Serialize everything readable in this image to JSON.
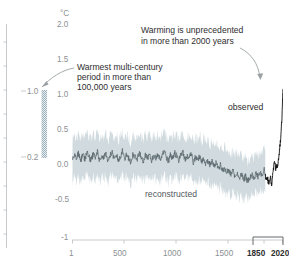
{
  "figure": {
    "yaxis_unit_label": "°C",
    "y_ticklabels": [
      "2.0",
      "1.5",
      "1.0",
      "0.5",
      "0.0",
      "-0.5",
      "-1"
    ],
    "x_ticklabels": [
      "1",
      "500",
      "1000",
      "1500",
      "1850",
      "2020"
    ],
    "x_bold_labels": [
      "1850",
      "2020"
    ],
    "series_labels": {
      "observed": "observed",
      "reconstructed": "reconstructed"
    },
    "annotations": {
      "left": [
        "Warmest multi-century",
        "period in more than",
        "100,000 years"
      ],
      "right": [
        "Warming is unprecedented",
        "in more than 2000 years"
      ]
    },
    "side_axis": {
      "labels": [
        "1.0",
        "0.2"
      ],
      "bar_top_value": "1.0",
      "bar_bottom_value": "0.2"
    },
    "colors": {
      "band": "#ccd7dc",
      "reconstructed_line": "#5b686f",
      "observed_line": "#111111",
      "axis": "#b9bdbf",
      "ticklabel": "#8c9194",
      "annotation_text": "#2e2e2e",
      "arrow": "#9aa0a3",
      "side_bar": "#b9c8ce"
    }
  },
  "chart_data": {
    "type": "line",
    "title": "",
    "xlabel": "",
    "ylabel": "°C",
    "xlim": [
      1,
      2020
    ],
    "ylim": [
      -1,
      2.0
    ],
    "yticks": [
      -1,
      -0.5,
      0.0,
      0.5,
      1.0,
      1.5,
      2.0
    ],
    "xticks": [
      1,
      500,
      1000,
      1500,
      1850,
      2020
    ],
    "grid": false,
    "legend": "inline-labels",
    "annotations": [
      {
        "text": "Warmest multi-century period in more than 100,000 years",
        "target": "side-bar",
        "x": 700,
        "y": 1.35
      },
      {
        "text": "Warming is unprecedented in more than 2000 years",
        "target": "observed-spike",
        "x": 1450,
        "y": 1.85
      }
    ],
    "side_bar": {
      "label": "multi-century warm period range",
      "y_from": 0.2,
      "y_to": 1.0,
      "ticks": [
        1.0,
        0.2
      ]
    },
    "series": [
      {
        "name": "reconstructed",
        "type": "line",
        "color": "#5b686f",
        "x": [
          1,
          20,
          40,
          60,
          80,
          100,
          120,
          140,
          160,
          180,
          200,
          220,
          240,
          260,
          280,
          300,
          320,
          340,
          360,
          380,
          400,
          420,
          440,
          460,
          480,
          500,
          520,
          540,
          560,
          580,
          600,
          620,
          640,
          660,
          680,
          700,
          720,
          740,
          760,
          780,
          800,
          820,
          840,
          860,
          880,
          900,
          920,
          940,
          960,
          980,
          1000,
          1020,
          1040,
          1060,
          1080,
          1100,
          1120,
          1140,
          1160,
          1180,
          1200,
          1220,
          1240,
          1260,
          1280,
          1300,
          1320,
          1340,
          1360,
          1380,
          1400,
          1420,
          1440,
          1460,
          1480,
          1500,
          1520,
          1540,
          1560,
          1580,
          1600,
          1620,
          1640,
          1660,
          1680,
          1700,
          1720,
          1740,
          1760,
          1780,
          1800,
          1820,
          1840,
          1850
        ],
        "y": [
          0.1,
          0.17,
          0.12,
          0.2,
          0.08,
          0.18,
          0.11,
          0.21,
          0.14,
          0.09,
          0.19,
          0.12,
          0.22,
          0.1,
          0.17,
          0.13,
          0.2,
          0.08,
          0.16,
          0.21,
          0.12,
          0.18,
          0.09,
          0.15,
          0.22,
          0.11,
          0.17,
          0.13,
          0.06,
          0.19,
          0.14,
          0.1,
          0.2,
          0.15,
          0.08,
          0.18,
          0.12,
          0.21,
          0.09,
          0.16,
          0.13,
          0.19,
          0.1,
          0.17,
          0.22,
          0.14,
          0.08,
          0.18,
          0.12,
          0.2,
          0.15,
          0.09,
          0.17,
          0.21,
          0.11,
          0.16,
          0.13,
          0.19,
          0.07,
          0.14,
          0.1,
          0.16,
          0.08,
          0.12,
          0.05,
          0.1,
          0.03,
          0.08,
          0.01,
          0.06,
          -0.02,
          0.04,
          -0.05,
          0.0,
          -0.08,
          -0.03,
          -0.1,
          -0.05,
          -0.12,
          -0.07,
          -0.15,
          -0.09,
          -0.18,
          -0.12,
          -0.2,
          -0.14,
          -0.1,
          -0.16,
          -0.08,
          -0.13,
          -0.06,
          -0.11,
          -0.04,
          -0.09
        ],
        "band_lower": [
          -0.2,
          -0.12,
          -0.18,
          -0.1,
          -0.22,
          -0.12,
          -0.19,
          -0.09,
          -0.16,
          -0.21,
          -0.11,
          -0.18,
          -0.08,
          -0.2,
          -0.13,
          -0.17,
          -0.1,
          -0.22,
          -0.14,
          -0.09,
          -0.18,
          -0.12,
          -0.21,
          -0.15,
          -0.08,
          -0.19,
          -0.13,
          -0.17,
          -0.24,
          -0.11,
          -0.16,
          -0.2,
          -0.1,
          -0.15,
          -0.22,
          -0.12,
          -0.18,
          -0.09,
          -0.21,
          -0.14,
          -0.17,
          -0.11,
          -0.2,
          -0.13,
          -0.08,
          -0.16,
          -0.22,
          -0.12,
          -0.18,
          -0.1,
          -0.15,
          -0.21,
          -0.13,
          -0.09,
          -0.19,
          -0.14,
          -0.17,
          -0.11,
          -0.23,
          -0.16,
          -0.2,
          -0.14,
          -0.22,
          -0.18,
          -0.25,
          -0.2,
          -0.27,
          -0.22,
          -0.29,
          -0.24,
          -0.32,
          -0.26,
          -0.35,
          -0.3,
          -0.38,
          -0.33,
          -0.4,
          -0.35,
          -0.42,
          -0.37,
          -0.45,
          -0.39,
          -0.46,
          -0.42,
          -0.44,
          -0.4,
          -0.36,
          -0.42,
          -0.34,
          -0.39,
          -0.32,
          -0.37,
          -0.3,
          -0.35
        ],
        "band_upper": [
          0.38,
          0.45,
          0.4,
          0.48,
          0.36,
          0.46,
          0.39,
          0.49,
          0.42,
          0.37,
          0.47,
          0.4,
          0.5,
          0.38,
          0.45,
          0.41,
          0.48,
          0.36,
          0.44,
          0.49,
          0.4,
          0.46,
          0.37,
          0.43,
          0.5,
          0.39,
          0.45,
          0.41,
          0.34,
          0.47,
          0.42,
          0.38,
          0.48,
          0.43,
          0.36,
          0.46,
          0.4,
          0.49,
          0.37,
          0.44,
          0.41,
          0.47,
          0.38,
          0.45,
          0.5,
          0.42,
          0.36,
          0.46,
          0.4,
          0.48,
          0.43,
          0.37,
          0.45,
          0.49,
          0.39,
          0.44,
          0.41,
          0.47,
          0.35,
          0.42,
          0.38,
          0.44,
          0.36,
          0.4,
          0.33,
          0.38,
          0.31,
          0.36,
          0.29,
          0.34,
          0.26,
          0.32,
          0.23,
          0.28,
          0.2,
          0.25,
          0.18,
          0.23,
          0.16,
          0.21,
          0.13,
          0.19,
          0.1,
          0.16,
          0.08,
          0.14,
          0.18,
          0.12,
          0.2,
          0.15,
          0.22,
          0.17,
          0.24,
          0.19
        ]
      },
      {
        "name": "observed",
        "type": "line",
        "color": "#111111",
        "x": [
          1850,
          1860,
          1870,
          1880,
          1890,
          1900,
          1910,
          1920,
          1930,
          1940,
          1950,
          1960,
          1970,
          1980,
          1990,
          2000,
          2010,
          2020
        ],
        "y": [
          -0.1,
          -0.16,
          -0.14,
          -0.2,
          -0.22,
          -0.12,
          -0.25,
          -0.1,
          0.0,
          0.08,
          -0.02,
          0.02,
          0.0,
          0.14,
          0.28,
          0.42,
          0.7,
          1.08
        ]
      }
    ]
  }
}
